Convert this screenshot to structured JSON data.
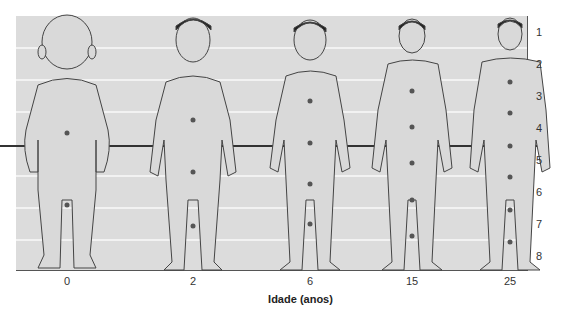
{
  "figure": {
    "title": "",
    "xlabel": "Idade (anos)",
    "scale_labels": [
      "1",
      "2",
      "3",
      "4",
      "5",
      "6",
      "7",
      "8"
    ],
    "ages": [
      "0",
      "2",
      "6",
      "15",
      "25"
    ],
    "colors": {
      "panel_background": "#dcdcdc",
      "band_lines": "#f2f2f2",
      "midline": "#333333",
      "outline": "#444444",
      "skin": "#d9d9d9",
      "marker": "#555555",
      "hair": "#222222"
    }
  },
  "figures": [
    {
      "age": "0",
      "label": "newborn",
      "center_x": 67,
      "head_fraction": "1/4"
    },
    {
      "age": "2",
      "label": "toddler",
      "center_x": 193,
      "head_fraction": "1/5"
    },
    {
      "age": "6",
      "label": "child",
      "center_x": 310,
      "head_fraction": "1/6"
    },
    {
      "age": "15",
      "label": "adolescent",
      "center_x": 412,
      "head_fraction": "1/7"
    },
    {
      "age": "25",
      "label": "adult",
      "center_x": 510,
      "head_fraction": "1/8"
    }
  ]
}
